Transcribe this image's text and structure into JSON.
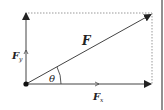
{
  "diagram": {
    "labels": {
      "resultant": "F",
      "y_component_main": "F",
      "y_component_sub": "y",
      "x_component_main": "F",
      "x_component_sub": "x",
      "angle": "θ"
    },
    "colors": {
      "line": "#333333",
      "dotted": "#999999",
      "background": "#ffffff"
    },
    "vectors": [
      {
        "name": "F",
        "from": [
          26,
          84
        ],
        "to": [
          152,
          14
        ]
      },
      {
        "name": "Fx",
        "from": [
          26,
          84
        ],
        "to": [
          152,
          84
        ]
      },
      {
        "name": "Fy",
        "from": [
          26,
          84
        ],
        "to": [
          26,
          12
        ]
      }
    ]
  }
}
